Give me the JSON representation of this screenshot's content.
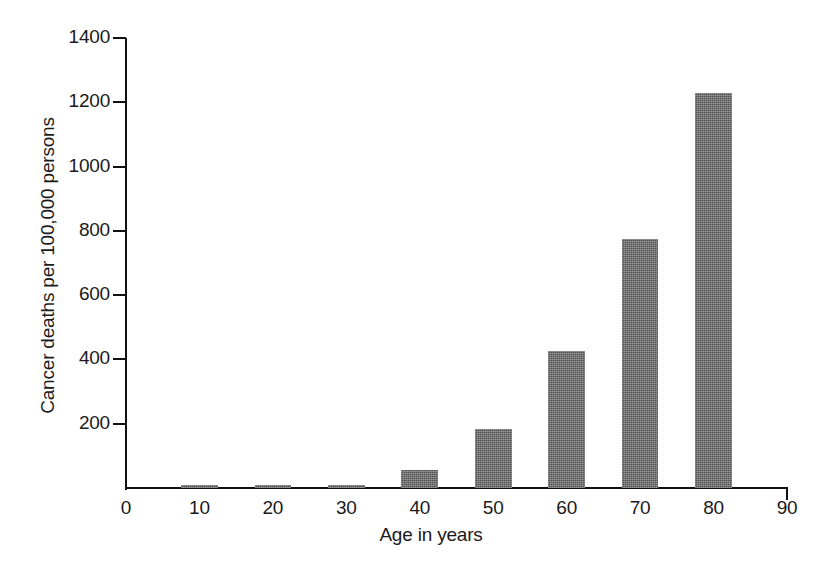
{
  "chart_data": {
    "type": "bar",
    "title": "",
    "xlabel": "Age in years",
    "ylabel": "Cancer deaths per 100,000 persons",
    "categories": [
      "10",
      "20",
      "30",
      "40",
      "50",
      "60",
      "70",
      "80"
    ],
    "x": [
      10,
      20,
      30,
      40,
      50,
      60,
      70,
      80
    ],
    "values": [
      10,
      10,
      10,
      55,
      185,
      425,
      775,
      1230
    ],
    "xlim": [
      0,
      90
    ],
    "ylim": [
      0,
      1400
    ],
    "xticks": [
      0,
      10,
      20,
      30,
      40,
      50,
      60,
      70,
      80,
      90
    ],
    "yticks": [
      0,
      200,
      400,
      600,
      800,
      1000,
      1200,
      1400
    ],
    "xtick_labels": [
      "0",
      "10",
      "20",
      "30",
      "40",
      "50",
      "60",
      "70",
      "80",
      "90"
    ],
    "ytick_labels": [
      "0",
      "200",
      "400",
      "600",
      "800",
      "1000",
      "1200",
      "1400"
    ],
    "grid": false,
    "legend": false,
    "bar_color": "#6e6e6e",
    "axis_color": "#111111",
    "background": "#ffffff",
    "bar_width_years": 5
  },
  "figure": {
    "y_axis_title": "Cancer deaths per 100,000 persons",
    "x_axis_title": "Age in years"
  }
}
